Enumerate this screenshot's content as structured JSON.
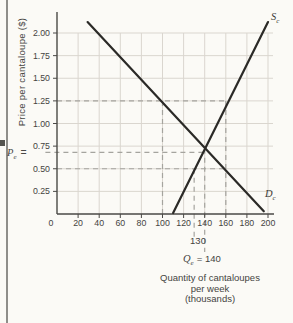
{
  "page": {
    "background_color": "#fbfaf6",
    "edge_line_color": "#8f8e8a"
  },
  "chart_data": {
    "type": "line",
    "title": "",
    "ylabel": "Price per cantaloupe ($)",
    "xlabel_lines": [
      "Quantity of cantaloupes",
      "per week",
      "(thousands)"
    ],
    "x_ticks": [
      0,
      20,
      40,
      60,
      80,
      100,
      120,
      140,
      160,
      180,
      200
    ],
    "y_ticks": [
      0.25,
      0.5,
      0.75,
      1.0,
      1.25,
      1.5,
      1.75,
      2.0
    ],
    "xlim": [
      0,
      205
    ],
    "ylim": [
      0,
      2.15
    ],
    "grid": true,
    "series": [
      {
        "name": "supply",
        "label": "S",
        "label_sub": "c",
        "points": [
          [
            110,
            0.01
          ],
          [
            200,
            2.12
          ]
        ]
      },
      {
        "name": "demand",
        "label": "D",
        "label_sub": "c",
        "points": [
          [
            29,
            2.12
          ],
          [
            196,
            0.03
          ]
        ]
      }
    ],
    "dashed_guides": {
      "horizontal": [
        {
          "p": 1.25,
          "from_q": 0,
          "to_q": 161
        },
        {
          "p": 0.68,
          "from_q": -11,
          "to_q": 140
        },
        {
          "p": 0.5,
          "from_q": 0,
          "to_q": 162
        }
      ],
      "vertical": [
        {
          "q": 100,
          "from_p": 1.25,
          "to_p": 0
        },
        {
          "q": 160,
          "from_p": 1.25,
          "to_p": 0
        },
        {
          "q": 130,
          "from_p": 0.5,
          "to_p": -0.27
        },
        {
          "q": 140,
          "from_p": 0.72,
          "to_p": -0.42
        }
      ]
    },
    "key_points": {
      "equilibrium": {
        "quantity": 140,
        "price": 0.7
      },
      "at_price_1_25": {
        "quantity_demanded": 100,
        "quantity_supplied": 160
      },
      "at_price_0_50": {
        "quantity_demanded": 160,
        "quantity_supplied": 130
      }
    },
    "labels": {
      "supply": {
        "main": "S",
        "sub": "c"
      },
      "demand": {
        "main": "D",
        "sub": "c"
      },
      "pe": {
        "main": "P",
        "sub": "e",
        "eq": "="
      },
      "qe": {
        "main": "Q",
        "sub": "e",
        "eq": "= 140"
      },
      "qty_130": "130"
    },
    "colors": {
      "grid": "#dad6cf",
      "dashed": "#a5a49e",
      "axis": "#4a4946",
      "curve": "#2b2a27",
      "tick_text": "#45443f"
    }
  }
}
